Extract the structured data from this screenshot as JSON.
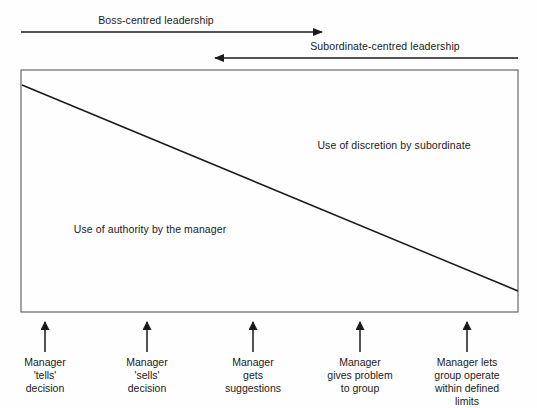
{
  "figure": {
    "type": "diagram",
    "name": "tannenbaum-schmidt-leadership-continuum",
    "background_color": "#fefefe",
    "line_color": "#1a1a1a",
    "border_color": "#5a5a5a"
  },
  "top_arrows": [
    {
      "name": "boss-centred-arrow",
      "label": "Boss-centred leadership",
      "direction": "right",
      "x1": 21,
      "x2": 325,
      "y": 32,
      "label_x": 156,
      "label_y": 14
    },
    {
      "name": "subordinate-centred-arrow",
      "label": "Subordinate-centred leadership",
      "direction": "left",
      "x1": 518,
      "x2": 212,
      "y": 58,
      "label_x": 385,
      "label_y": 40
    }
  ],
  "plot_box": {
    "x": 21,
    "y": 70,
    "width": 497,
    "height": 242
  },
  "diagonal": {
    "name": "authority-discretion-divider",
    "x1": 22,
    "y1": 85,
    "x2": 518,
    "y2": 291
  },
  "regions": [
    {
      "name": "discretion-region-label",
      "label": "Use of discretion by subordinate",
      "x": 394,
      "y": 139
    },
    {
      "name": "authority-region-label",
      "label": "Use of authority by the manager",
      "x": 150,
      "y": 223
    }
  ],
  "steps": [
    {
      "name": "step-tells",
      "x": 45,
      "arrow_top": 322,
      "arrow_bottom": 352,
      "lines": [
        "Manager",
        "'tells'",
        "decision"
      ]
    },
    {
      "name": "step-sells",
      "x": 147,
      "arrow_top": 322,
      "arrow_bottom": 352,
      "lines": [
        "Manager",
        "'sells'",
        "decision"
      ]
    },
    {
      "name": "step-suggestions",
      "x": 253,
      "arrow_top": 322,
      "arrow_bottom": 352,
      "lines": [
        "Manager",
        "gets",
        "suggestions"
      ]
    },
    {
      "name": "step-problem",
      "x": 360,
      "arrow_top": 322,
      "arrow_bottom": 352,
      "lines": [
        "Manager",
        "gives problem",
        "to group"
      ]
    },
    {
      "name": "step-group-operate",
      "x": 467,
      "arrow_top": 322,
      "arrow_bottom": 352,
      "lines": [
        "Manager lets",
        "group operate",
        "within defined",
        "limits"
      ]
    }
  ]
}
